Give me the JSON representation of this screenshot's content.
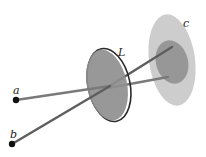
{
  "diagram": {
    "labels": {
      "point_a": "a",
      "point_b": "b",
      "lens": "L",
      "plane": "c"
    },
    "colors": {
      "background": "#ffffff",
      "lens_fill": "#8f8f8f",
      "lens_rim": "#2a2a2a",
      "plane_outer": "#c4c4c4",
      "plane_inner": "#8a8a8a",
      "ray": "#6e6e6e",
      "point": "#111111",
      "label": "#222222"
    },
    "elements": [
      {
        "name": "point-a",
        "label": "a"
      },
      {
        "name": "point-b",
        "label": "b"
      },
      {
        "name": "lens",
        "label": "L"
      },
      {
        "name": "image-plane",
        "label": "c"
      }
    ]
  }
}
